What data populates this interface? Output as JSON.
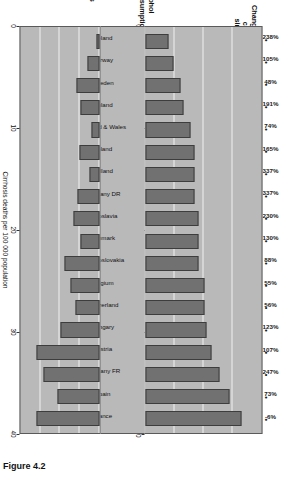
{
  "figure": {
    "caption": "Figure 4.2"
  },
  "panels": {
    "alcohol_title": "Alcohol\nconsumption",
    "change_title": "Change in alcohol\nconsumption\nsince 1950–52",
    "cirrhosis_title": "Cirrhosis\nof liver"
  },
  "axes": {
    "alcohol_label": "Litres pure alcohol per capita",
    "alcohol_ticks": [
      "0",
      "5",
      "10",
      "15",
      "20"
    ],
    "cirrhosis_label": "Cirrhosis deaths per 100 000 population",
    "cirrhosis_ticks": [
      "0",
      "10",
      "20",
      "30",
      "40"
    ]
  },
  "chart_data": {
    "type": "bar",
    "categories": [
      "Iceland",
      "Norway",
      "Sweden",
      "Finland",
      "England & Wales",
      "Poland",
      "Holland",
      "Germany DR",
      "Yugoslavia",
      "Denmark",
      "Czechoslovakia",
      "Belgium",
      "Switzerland",
      "Hungary",
      "Austria",
      "Germany FR",
      "Spain",
      "France"
    ],
    "series": [
      {
        "name": "Alcohol consumption",
        "unit": "Litres pure alcohol per capita",
        "ylim": [
          0,
          20
        ],
        "ticks": [
          0,
          5,
          10,
          15,
          20
        ],
        "values": [
          3.9,
          4.8,
          6.1,
          6.6,
          7.8,
          8.5,
          8.5,
          8.5,
          9.2,
          9.2,
          9.2,
          10.1,
          10.2,
          10.6,
          11.4,
          12.8,
          14.4,
          16.6
        ]
      },
      {
        "name": "Cirrhosis of liver",
        "unit": "Cirrhosis deaths per 100 000 population",
        "ylim": [
          0,
          40
        ],
        "ticks": [
          0,
          10,
          20,
          30,
          40
        ],
        "values": [
          1.6,
          6.1,
          11.6,
          9.4,
          4.2,
          10.0,
          5.2,
          11.3,
          13.3,
          9.8,
          17.5,
          14.5,
          12.1,
          19.8,
          32.0,
          28.5,
          21.5,
          32.0
        ]
      },
      {
        "name": "Change in alcohol consumption since 1950–52",
        "unit": "percent",
        "labels": [
          "238%",
          "105%",
          "48%",
          "191%",
          "74%",
          "165%",
          "337%",
          "337%",
          "230%",
          "130%",
          "88%",
          "55%",
          "56%",
          "123%",
          "107%",
          "247%",
          "73%",
          "-6%"
        ],
        "values": [
          238,
          105,
          48,
          191,
          74,
          165,
          337,
          337,
          230,
          130,
          88,
          55,
          56,
          123,
          107,
          247,
          73,
          -6
        ]
      }
    ],
    "xlabel": "",
    "grid": true,
    "legend": "none",
    "orientation": "rotated-90"
  }
}
